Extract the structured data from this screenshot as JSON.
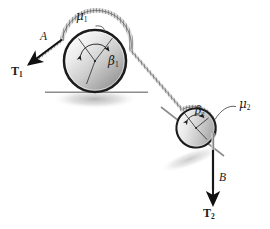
{
  "figure": {
    "background_color": "#ffffff",
    "ink_color": "#1a1a1a"
  },
  "labels": {
    "mu1": "μ",
    "mu1_sub": "1",
    "mu2": "μ",
    "mu2_sub": "2",
    "beta1": "β",
    "beta1_sub": "1",
    "beta2": "β",
    "beta2_sub": "2",
    "segment_a": "A",
    "segment_b": "B",
    "tension1": "T",
    "tension1_sub": "1",
    "tension2": "T",
    "tension2_sub": "2"
  },
  "elements": {
    "drum1_name": "large-drum",
    "drum2_name": "small-drum",
    "ground_name": "horizontal-ground-line",
    "incline_name": "inclined-support-line",
    "rope_name": "rope-belt"
  },
  "colors": {
    "rim": "#1c1c1c",
    "drum_light": "#fbfbfb",
    "drum_mid": "#c9c9c9",
    "drum_dark": "#8e8e8e",
    "shadow": "#c4c4c4",
    "rope": "#6e6e6e",
    "arrow": "#111111",
    "ground": "#8a8a8a"
  },
  "geometry": {
    "drum1": {
      "cx": 95,
      "cy": 61,
      "r": 31
    },
    "drum2": {
      "cx": 196,
      "cy": 128,
      "r": 19,
      "tilt_deg": -38
    },
    "ground_y": 92,
    "tension1_angle_deg": 205,
    "tension2_angle_deg": 270
  }
}
